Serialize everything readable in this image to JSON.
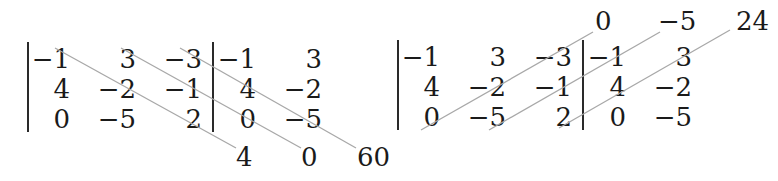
{
  "diagrams": [
    {
      "name": "sarrus-down-diagonals",
      "matrix": [
        [
          "−1",
          "3",
          "−3"
        ],
        [
          "4",
          "−2",
          "−1"
        ],
        [
          "0",
          "−5",
          "2"
        ]
      ],
      "augmented": [
        [
          "−1",
          "3"
        ],
        [
          "4",
          "−2"
        ],
        [
          "0",
          "−5"
        ]
      ],
      "products": [
        "4",
        "0",
        "60"
      ],
      "product_position": "bottom",
      "diagonal_direction": "down-right"
    },
    {
      "name": "sarrus-up-diagonals",
      "matrix": [
        [
          "−1",
          "3",
          "−3"
        ],
        [
          "4",
          "−2",
          "−1"
        ],
        [
          "0",
          "−5",
          "2"
        ]
      ],
      "augmented": [
        [
          "−1",
          "3"
        ],
        [
          "4",
          "−2"
        ],
        [
          "0",
          "−5"
        ]
      ],
      "products": [
        "0",
        "−5",
        "24"
      ],
      "product_position": "top",
      "diagonal_direction": "up-right"
    }
  ],
  "colors": {
    "text": "#1a1a1a",
    "diagonal_line": "#a8a8a8",
    "bar": "#2a2a2a",
    "background": "#ffffff"
  }
}
